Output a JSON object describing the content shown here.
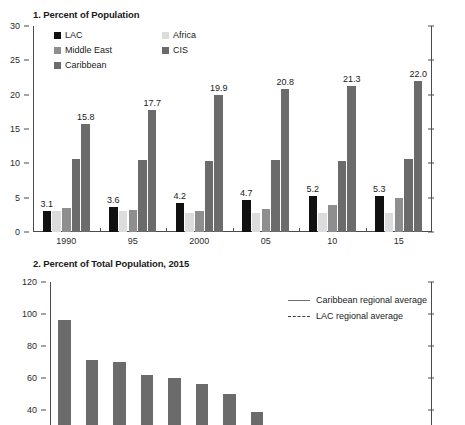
{
  "panel1": {
    "title": "1. Percent of Population",
    "legend": [
      {
        "label": "LAC",
        "color": "#111111"
      },
      {
        "label": "Africa",
        "color": "#dcdcdc"
      },
      {
        "label": "Middle East",
        "color": "#8e8e8e"
      },
      {
        "label": "CIS",
        "color": "#6b6b6b"
      },
      {
        "label": "Caribbean",
        "color": "#6b6b6b"
      }
    ]
  },
  "panel2": {
    "title": "2. Percent of Total Population, 2015",
    "legend": [
      {
        "label": "Caribbean regional average",
        "style": "solid"
      },
      {
        "label": "LAC regional average",
        "style": "dashed"
      }
    ]
  },
  "chart_data": [
    {
      "type": "bar",
      "title": "1. Percent of Population",
      "xlabel": "",
      "ylabel": "Percent of population",
      "categories": [
        "1990",
        "95",
        "2000",
        "05",
        "10",
        "15"
      ],
      "ylim": [
        0,
        30
      ],
      "yticks": [
        0,
        5,
        10,
        15,
        20,
        25,
        30
      ],
      "grid": false,
      "legend_position": "top-left",
      "series": [
        {
          "name": "LAC",
          "color": "#111111",
          "values": [
            3.1,
            3.6,
            4.2,
            4.7,
            5.2,
            5.3
          ],
          "data_labels": [
            "3.1",
            "3.6",
            "4.2",
            "4.7",
            "5.2",
            "5.3"
          ]
        },
        {
          "name": "Africa",
          "color": "#dcdcdc",
          "values": [
            3.1,
            3.0,
            2.7,
            2.8,
            2.8,
            2.8
          ]
        },
        {
          "name": "Middle East",
          "color": "#8e8e8e",
          "values": [
            3.5,
            3.2,
            3.0,
            3.3,
            4.0,
            5.0
          ]
        },
        {
          "name": "Caribbean",
          "color": "#6b6b6b",
          "values": [
            10.6,
            10.5,
            10.3,
            10.5,
            10.4,
            10.6
          ]
        },
        {
          "name": "CIS",
          "color": "#6b6b6b",
          "values": [
            15.8,
            17.7,
            19.9,
            20.8,
            21.3,
            22.0
          ],
          "data_labels": [
            "15.8",
            "17.7",
            "19.9",
            "20.8",
            "21.3",
            "22.0"
          ]
        }
      ]
    },
    {
      "type": "bar",
      "title": "2. Percent of Total Population, 2015",
      "xlabel": "",
      "ylabel": "Percent of total population",
      "ylim": [
        20,
        120
      ],
      "yticks": [
        40,
        60,
        80,
        100,
        120
      ],
      "grid": false,
      "legend_position": "top-right",
      "note": "chart is cropped at the bottom edge of the screenshot",
      "categories": [
        "1",
        "2",
        "3",
        "4",
        "5",
        "6",
        "7",
        "8"
      ],
      "values": [
        96,
        71,
        70,
        62,
        60,
        56,
        50,
        39
      ],
      "series": [
        {
          "name": "Percent of total population",
          "color": "#6b6b6b",
          "values": [
            96,
            71,
            70,
            62,
            60,
            56,
            50,
            39
          ]
        }
      ],
      "reference_lines": [
        {
          "name": "Caribbean regional average",
          "style": "solid"
        },
        {
          "name": "LAC regional average",
          "style": "dashed"
        }
      ]
    }
  ]
}
